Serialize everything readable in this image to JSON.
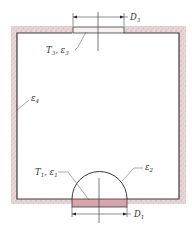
{
  "diagram": {
    "labels": {
      "d3": {
        "main": "D",
        "sub": "3"
      },
      "t3": {
        "main": "T",
        "sub": "3",
        "sep": ", ",
        "main2": "ε",
        "sub2": "3"
      },
      "e4": {
        "main": "ε",
        "sub": "4"
      },
      "t1": {
        "main": "T",
        "sub": "1",
        "sep": ", ",
        "main2": "ε",
        "sub2": "1"
      },
      "e2": {
        "main": "ε",
        "sub": "2"
      },
      "d1": {
        "main": "D",
        "sub": "1"
      }
    },
    "colors": {
      "wall_line": "#3a3a3a",
      "insulation": "#e8d3d6",
      "insulation_speckle": "#a58a8e",
      "disk_top_fill": "#f5f1f1",
      "disk_bottom_fill": "#d9a3ab",
      "leader": "#555555"
    }
  }
}
